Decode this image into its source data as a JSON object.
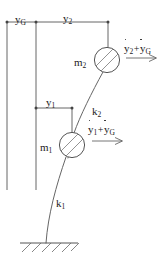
{
  "figure": {
    "background_color": "#ffffff",
    "line_color": "#555555",
    "text_color": "#222222"
  },
  "labels": {
    "ground_displacement": {
      "base": "y",
      "sub": "G"
    },
    "top_displacement": {
      "base": "y",
      "sub": "2"
    },
    "mid_displacement": {
      "base": "y",
      "sub": "1"
    },
    "upper_stiffness": {
      "base": "k",
      "sub": "2"
    },
    "lower_stiffness": {
      "base": "k",
      "sub": "1"
    },
    "upper_mass": {
      "base": "m",
      "sub": "2"
    },
    "lower_mass": {
      "base": "m",
      "sub": "1"
    },
    "upper_velocity": {
      "term1_base": "y",
      "term1_sub": "2",
      "plus": "+",
      "term2_base": "y",
      "term2_sub": "G"
    },
    "lower_velocity": {
      "term1_base": "y",
      "term1_sub": "1",
      "plus": "+",
      "term2_base": "y",
      "term2_sub": "G"
    }
  },
  "geometry": {
    "inertial_reference_line": {
      "x": 7,
      "y_top": 22,
      "y_bottom": 190
    },
    "ground_reference_line": {
      "x": 36,
      "y_top": 22,
      "y_bottom": 190
    },
    "top_dimension_line": {
      "y": 22,
      "x_start": 7,
      "x_end": 108
    },
    "top_dimension_ticks": [
      7,
      36,
      108
    ],
    "mid_dimension_line": {
      "y": 108,
      "x_start": 36,
      "x_end": 72
    },
    "mid_dimension_ticks": [
      36,
      72
    ],
    "mass2": {
      "cx": 107,
      "cy": 60,
      "r": 13
    },
    "mass1": {
      "cx": 72,
      "cy": 145,
      "r": 13
    },
    "ground": {
      "y": 243,
      "x_start": 20,
      "x_end": 78,
      "hatch_count": 6
    },
    "arrow_upper": {
      "x_start": 126,
      "x_end": 156,
      "y": 58
    },
    "arrow_lower": {
      "x_start": 92,
      "x_end": 122,
      "y": 141
    }
  }
}
